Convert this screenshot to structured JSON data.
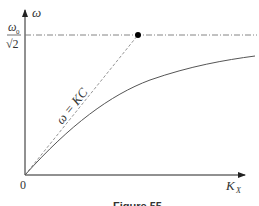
{
  "figure": {
    "y_axis_label": "ω",
    "x_axis_label_main": "K",
    "x_axis_label_sub": "X",
    "origin_label": "0",
    "y_tick_label_numerator": "ω",
    "y_tick_label_numerator_sub": "0",
    "y_tick_label_denominator": "√2",
    "asymptote_label": "ω = KC",
    "caption": "Figure 55"
  },
  "colors": {
    "axis": "#222222",
    "curve": "#555555",
    "dashed": "#888888",
    "point": "#000000"
  }
}
